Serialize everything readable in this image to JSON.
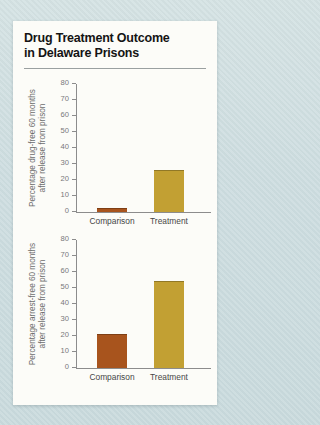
{
  "page": {
    "background_color": "#cfdee0",
    "card_background": "#fcfcf8"
  },
  "header": {
    "title_line1": "Drug Treatment Outcome",
    "title_line2": "in Delaware Prisons"
  },
  "style": {
    "comparison_bar_color": "#a8541d",
    "treatment_bar_color": "#c2a033",
    "axis_color": "#8c8c8c"
  },
  "chart_data": [
    {
      "type": "bar",
      "title": "",
      "categories": [
        "Comparison",
        "Treatment"
      ],
      "values": [
        2,
        26
      ],
      "bar_colors": [
        "#a8541d",
        "#c2a033"
      ],
      "ylabel_line1": "Percentage drug-free 60 months",
      "ylabel_line2": "after release from prison",
      "xlabel": "",
      "ylim": [
        0,
        80
      ],
      "ytick_step": 10,
      "ytick_labels": [
        "0",
        "10",
        "20",
        "30",
        "40",
        "50",
        "60",
        "70",
        "80"
      ],
      "grid": false,
      "legend": false
    },
    {
      "type": "bar",
      "title": "",
      "categories": [
        "Comparison",
        "Treatment"
      ],
      "values": [
        21,
        54
      ],
      "bar_colors": [
        "#a8541d",
        "#c2a033"
      ],
      "ylabel_line1": "Percentage arrest-free 60 months",
      "ylabel_line2": "after release from prison",
      "xlabel": "",
      "ylim": [
        0,
        80
      ],
      "ytick_step": 10,
      "ytick_labels": [
        "0",
        "10",
        "20",
        "30",
        "40",
        "50",
        "60",
        "70",
        "80"
      ],
      "grid": false,
      "legend": false
    }
  ]
}
